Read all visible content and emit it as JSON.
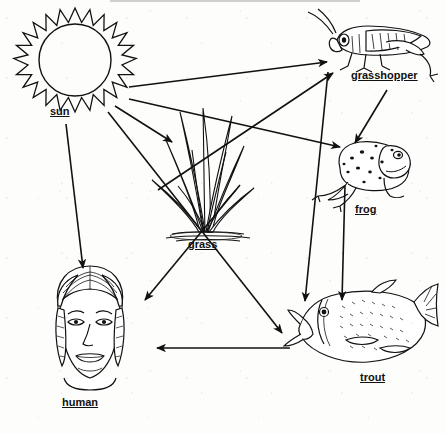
{
  "diagram": {
    "type": "food-web",
    "background_color": "#fdfdfb",
    "ink_color": "#111111",
    "width": 445,
    "height": 434
  },
  "nodes": [
    {
      "id": "sun",
      "label": "sun",
      "label_x": 50,
      "label_y": 105,
      "icon": "sun-icon",
      "x": 98,
      "y": 70
    },
    {
      "id": "grass",
      "label": "grass",
      "label_x": 188,
      "label_y": 238,
      "icon": "grass-icon",
      "x": 205,
      "y": 175
    },
    {
      "id": "grasshopper",
      "label": "grasshopper",
      "label_x": 351,
      "label_y": 69,
      "icon": "grasshopper-icon",
      "x": 383,
      "y": 40
    },
    {
      "id": "frog",
      "label": "frog",
      "label_x": 355,
      "label_y": 203,
      "icon": "frog-icon",
      "x": 370,
      "y": 170
    },
    {
      "id": "trout",
      "label": "trout",
      "label_x": 360,
      "label_y": 371,
      "icon": "trout-icon",
      "x": 365,
      "y": 315
    },
    {
      "id": "human",
      "label": "human",
      "label_x": 62,
      "label_y": 396,
      "icon": "human-icon",
      "x": 90,
      "y": 320
    }
  ],
  "edges": [
    {
      "id": "sun-grasshopper",
      "from": "sun",
      "to": "grasshopper",
      "x1": 129,
      "y1": 87,
      "x2": 327,
      "y2": 62
    },
    {
      "id": "sun-frog",
      "from": "sun",
      "to": "frog",
      "x1": 129,
      "y1": 99,
      "x2": 340,
      "y2": 147
    },
    {
      "id": "sun-grass",
      "from": "sun",
      "to": "grass",
      "x1": 115,
      "y1": 106,
      "x2": 172,
      "y2": 142
    },
    {
      "id": "sun-human",
      "from": "sun",
      "to": "human",
      "x1": 66,
      "y1": 124,
      "x2": 83,
      "y2": 268
    },
    {
      "id": "grass-grasshopper",
      "from": "grass",
      "to": "grasshopper",
      "x1": 158,
      "y1": 190,
      "x2": 333,
      "y2": 73
    },
    {
      "id": "grass-human",
      "from": "grass",
      "to": "human",
      "x1": 240,
      "y1": 185,
      "x2": 145,
      "y2": 300
    },
    {
      "id": "grass-trout",
      "from": "grass",
      "to": "trout",
      "x1": 108,
      "y1": 112,
      "x2": 282,
      "y2": 333
    },
    {
      "id": "grasshopper-frog",
      "from": "grasshopper",
      "to": "frog",
      "x1": 387,
      "y1": 90,
      "x2": 355,
      "y2": 143
    },
    {
      "id": "grasshopper-trout",
      "from": "grasshopper",
      "to": "trout",
      "x1": 328,
      "y1": 72,
      "x2": 305,
      "y2": 301
    },
    {
      "id": "frog-trout",
      "from": "frog",
      "to": "trout",
      "x1": 345,
      "y1": 185,
      "x2": 342,
      "y2": 300
    },
    {
      "id": "trout-human",
      "from": "trout",
      "to": "human",
      "x1": 290,
      "y1": 348,
      "x2": 157,
      "y2": 348
    }
  ]
}
